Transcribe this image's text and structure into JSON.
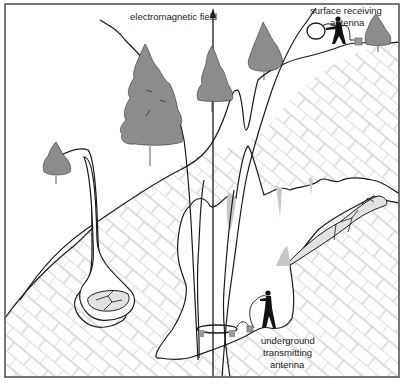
{
  "figure": {
    "labels": {
      "em_field": "electromagnetic field",
      "surface_antenna_line1": "surface receiving",
      "surface_antenna_line2": "antenna",
      "underground_antenna_line1": "underground",
      "underground_antenna_line2": "transmitting",
      "underground_antenna_line3": "antenna"
    },
    "colors": {
      "outline": "#1a1a1a",
      "tree_fill": "#8c8c8c",
      "rock_pattern": "#d4d4d4",
      "speleothem": "#c8c8c8",
      "rubble_fill": "#e2e2e2",
      "frame": "#555555"
    },
    "elements": [
      "frame",
      "rock-strata",
      "surface-profile",
      "trees",
      "cave-passage",
      "vertical-shafts",
      "field-lines",
      "surface-antenna",
      "surface-operator",
      "underground-antenna",
      "underground-operator",
      "speleothems",
      "rubble-piles"
    ]
  }
}
